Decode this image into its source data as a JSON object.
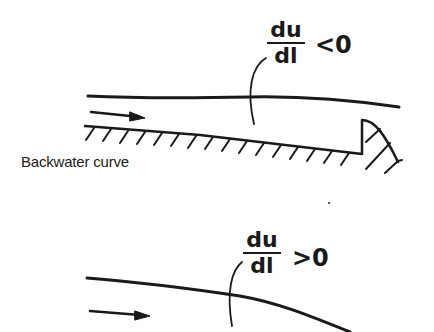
{
  "diagram": {
    "top_panel": {
      "caption": "Backwater curve",
      "expression": {
        "numerator": "du",
        "denominator": "dl",
        "relation": "<0"
      }
    },
    "bottom_panel": {
      "expression": {
        "numerator": "du",
        "denominator": "dl",
        "relation": ">0"
      }
    },
    "colors": {
      "ink": "#1a1a1a",
      "background": "#ffffff"
    }
  }
}
